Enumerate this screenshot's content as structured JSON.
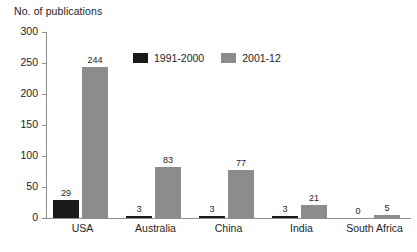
{
  "chart_data": {
    "type": "bar",
    "title": "No. of publications",
    "xlabel": "",
    "ylabel": "No. of publications",
    "ylim": [
      0,
      300
    ],
    "ytick_labels": [
      "0",
      "50",
      "100",
      "150",
      "200",
      "250",
      "300"
    ],
    "yticks": [
      0,
      50,
      100,
      150,
      200,
      250,
      300
    ],
    "grid": false,
    "legend_position": "inside-top-left",
    "categories": [
      "USA",
      "Australia",
      "China",
      "India",
      "South Africa"
    ],
    "series": [
      {
        "name": "1991-2000",
        "color": "#1a1a1a",
        "values": [
          29,
          3,
          3,
          3,
          0
        ],
        "labels": [
          "29",
          "3",
          "3",
          "3",
          "0"
        ]
      },
      {
        "name": "2001-12",
        "color": "#8c8c8c",
        "values": [
          244,
          83,
          77,
          21,
          5
        ],
        "labels": [
          "244",
          "83",
          "77",
          "21",
          "5"
        ]
      }
    ]
  },
  "legend": {
    "entries": [
      {
        "label": "1991-2000",
        "swatch": "legend-swatch-black"
      },
      {
        "label": "2001-12",
        "swatch": "legend-swatch-gray"
      }
    ]
  },
  "colors": {
    "series_1991_2000": "#1a1a1a",
    "series_2001_12": "#8c8c8c",
    "axis": "#8e8e8e",
    "text": "#1d1d1d",
    "background": "#ffffff"
  }
}
